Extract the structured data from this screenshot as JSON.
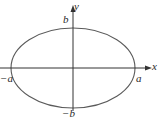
{
  "diagram": {
    "type": "ellipse",
    "labels": {
      "x_axis": "x",
      "y_axis": "y",
      "positive_major_vertex": "a",
      "negative_major_vertex": "−a",
      "positive_minor_vertex": "b",
      "negative_minor_vertex": "−b"
    },
    "geometry": {
      "center": [
        0,
        0
      ],
      "semi_major_axis_label": "a",
      "semi_minor_axis_label": "b",
      "major_axis_orientation": "horizontal"
    },
    "colors": {
      "stroke": "#555555",
      "axes": "#333333",
      "text": "#2a2a2a",
      "background": "#ffffff"
    }
  }
}
